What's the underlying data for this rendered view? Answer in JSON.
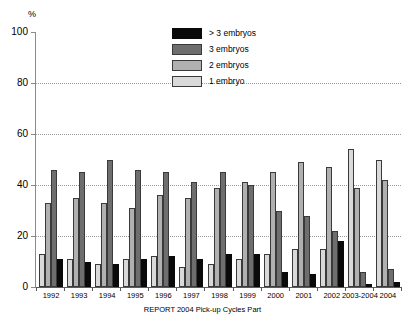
{
  "chart_data": {
    "type": "bar",
    "title": "",
    "subtitle": "",
    "caption": "REPORT 2004 Pick-up Cycles Part",
    "xlabel": "",
    "ylabel": "%",
    "ylim": [
      0,
      100
    ],
    "yticks": [
      0,
      20,
      40,
      60,
      80,
      100
    ],
    "ytick_labels": [
      "0",
      "20",
      "40",
      "60",
      "80",
      "100"
    ],
    "grid": "horizontal dotted gridlines at 20, 40, 60, 80",
    "legend_position": "top-center",
    "categories": [
      "1992",
      "1993",
      "1994",
      "1995",
      "1996",
      "1997",
      "1998",
      "1999",
      "2000",
      "2001",
      "2002",
      "2003-2004",
      "2004"
    ],
    "series": [
      {
        "name": "1 embryo",
        "color": "#d9d9d9",
        "values": [
          13,
          11,
          9,
          11,
          12,
          8,
          9,
          11,
          13,
          15,
          15,
          54,
          50
        ]
      },
      {
        "name": "2 embryos",
        "color": "#b0b0b0",
        "values": [
          33,
          35,
          33,
          31,
          36,
          35,
          39,
          41,
          45,
          49,
          47,
          39,
          42
        ]
      },
      {
        "name": "3 embryos",
        "color": "#6e6e6e",
        "values": [
          46,
          45,
          50,
          46,
          45,
          41,
          45,
          40,
          30,
          28,
          22,
          6,
          7
        ]
      },
      {
        "name": "> 3 embryos",
        "color": "#0a0a0a",
        "values": [
          11,
          10,
          9,
          11,
          12,
          11,
          13,
          13,
          6,
          5,
          18,
          1,
          2
        ]
      }
    ]
  },
  "legend": {
    "items": [
      {
        "label": "> 3 embryos",
        "color": "#0a0a0a"
      },
      {
        "label": "3 embryos",
        "color": "#6e6e6e"
      },
      {
        "label": "2 embryos",
        "color": "#b0b0b0"
      },
      {
        "label": "1 embryo",
        "color": "#d9d9d9"
      }
    ]
  },
  "axis": {
    "unit": "%"
  }
}
